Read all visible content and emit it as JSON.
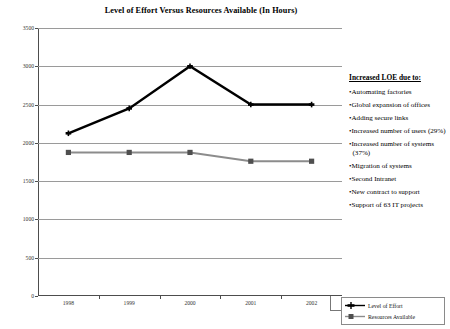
{
  "chart_data": {
    "type": "line",
    "title": "Level of Effort Versus Resources Available (In Hours)",
    "xlabel": "",
    "ylabel": "",
    "categories": [
      "1998",
      "1999",
      "2000",
      "2001",
      "2002"
    ],
    "ylim": [
      0,
      3500
    ],
    "ytick_step": 500,
    "yticks": [
      "0",
      "500",
      "1000",
      "1500",
      "2000",
      "2500",
      "3000",
      "3500"
    ],
    "grid": "horizontal",
    "legend_position": "bottom-right",
    "series": [
      {
        "name": "Level of Effort",
        "color": "#000000",
        "marker": "cross",
        "values": [
          2125,
          2450,
          3000,
          2500,
          2500
        ]
      },
      {
        "name": "Resources Available",
        "color": "#8c8c8c",
        "marker": "square",
        "values": [
          1875,
          1875,
          1875,
          1760,
          1760
        ]
      }
    ]
  },
  "notes": {
    "heading": "Increased LOE due to:",
    "items": [
      "Automating factories",
      "Global expansion of offices",
      "Adding secure links",
      "Increased number of users (29%)",
      "Increased number of systems (37%)",
      "Migration of systems",
      "Second Intranet",
      "New contract to support",
      "Support of 63 IT projects"
    ],
    "bullet": "•"
  }
}
